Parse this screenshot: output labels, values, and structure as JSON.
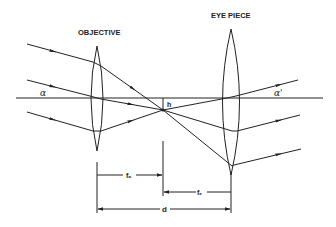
{
  "diagram": {
    "labels": {
      "objective": "OBJECTIVE",
      "eyepiece": "EYE PIECE",
      "alpha": "α",
      "alpha_prime": "α'",
      "h": "h",
      "f_o": "fₒ",
      "f_e": "fₑ",
      "d": "d"
    },
    "colors": {
      "line": "#222222",
      "background": "#ffffff"
    }
  }
}
